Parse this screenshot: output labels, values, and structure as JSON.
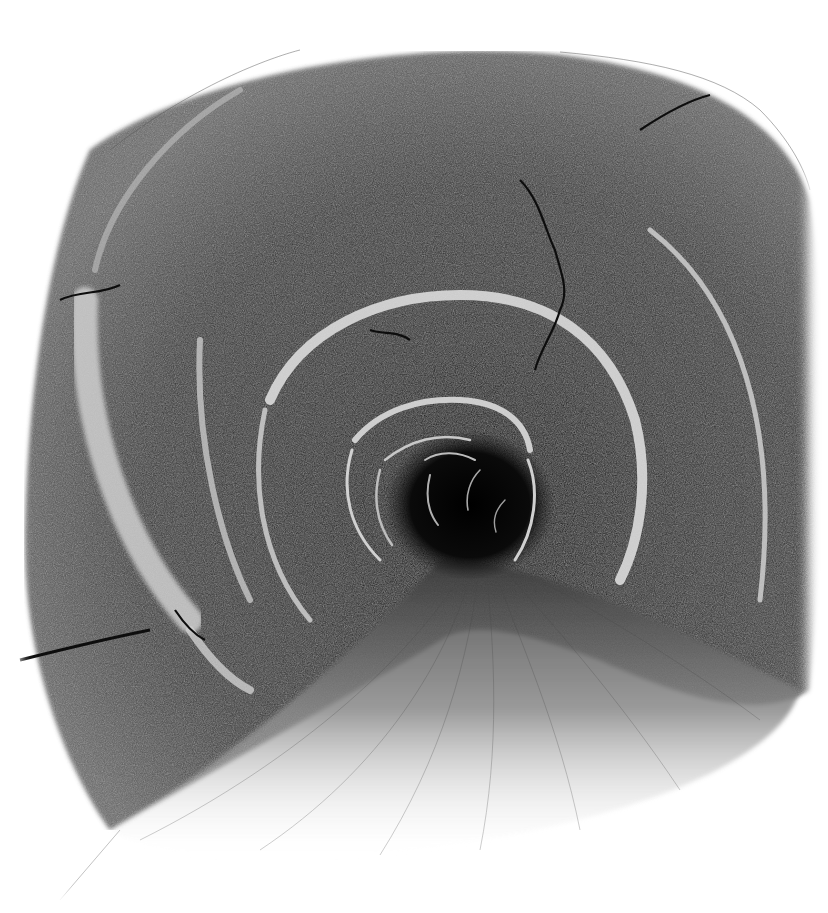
{
  "artwork": {
    "subject": "Pencil/charcoal drawing of a curved tunnel receding into darkness",
    "medium": "graphite / charcoal on white paper",
    "colors": {
      "paper": "#ffffff",
      "dark": "#1a1a1a",
      "mid": "#555555",
      "highlight": "#d8d8d8",
      "void": "#050505"
    },
    "elements": [
      "tunnel-walls",
      "concentric-ring-highlights",
      "dark-vanishing-point",
      "cracks",
      "tunnel-floor-path"
    ]
  }
}
